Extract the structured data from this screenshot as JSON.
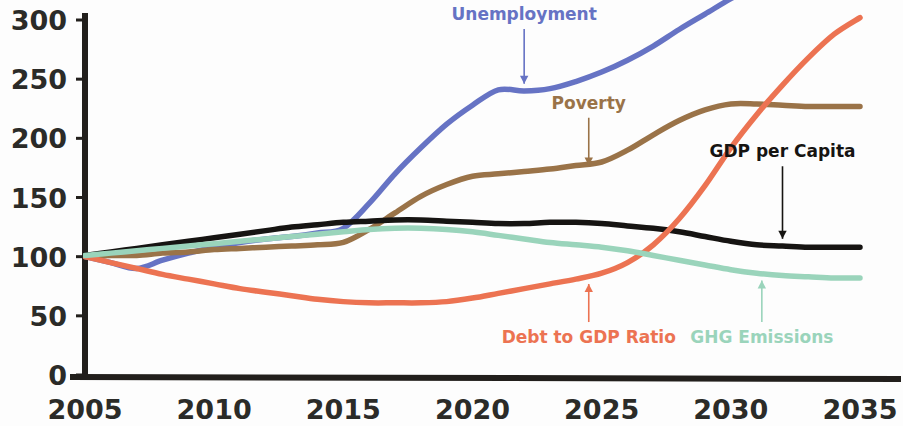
{
  "chart_data": {
    "type": "line",
    "title": "",
    "xlabel": "",
    "ylabel": "",
    "xlim": [
      2005,
      2035
    ],
    "ylim": [
      0,
      300
    ],
    "x_ticks": [
      "2005",
      "2010",
      "2015",
      "2020",
      "2025",
      "2030",
      "2035"
    ],
    "y_ticks": [
      "0",
      "50",
      "100",
      "150",
      "200",
      "250",
      "300"
    ],
    "grid": false,
    "legend_position": "inline-annotations",
    "index_base_note": "All series indexed to 100 at 2005",
    "x": [
      2005,
      2006,
      2007,
      2008,
      2009,
      2010,
      2011,
      2012,
      2013,
      2014,
      2015,
      2016,
      2017,
      2018,
      2019,
      2020,
      2021,
      2022,
      2023,
      2024,
      2025,
      2026,
      2027,
      2028,
      2029,
      2030,
      2031,
      2032,
      2033,
      2034,
      2035
    ],
    "series": [
      {
        "name": "Unemployment",
        "color": "#6673c4",
        "label_color": "#6673c4",
        "values": [
          100,
          95,
          90,
          97,
          103,
          108,
          112,
          115,
          117,
          120,
          124,
          145,
          170,
          192,
          212,
          228,
          241,
          240,
          242,
          248,
          256,
          266,
          278,
          292,
          305,
          318,
          330,
          342,
          354,
          366,
          378
        ],
        "label_x": 2022,
        "label_y": 300,
        "arrow_target_y": 241
      },
      {
        "name": "Poverty",
        "color": "#9a7348",
        "label_color": "#9a7348",
        "values": [
          100,
          101,
          101,
          103,
          104,
          106,
          107,
          108,
          109,
          110,
          112,
          123,
          137,
          151,
          161,
          168,
          170,
          172,
          174,
          177,
          180,
          190,
          203,
          215,
          224,
          229,
          229,
          228,
          227,
          227,
          227
        ],
        "label_x": 2024.5,
        "label_y": 225,
        "arrow_target_y": 172
      },
      {
        "name": "GDP per Capita",
        "color": "#161412",
        "label_color": "#161412",
        "values": [
          101,
          104,
          107,
          110,
          113,
          116,
          119,
          122,
          125,
          127,
          129,
          130,
          131,
          131,
          130,
          129,
          128,
          128,
          129,
          129,
          128,
          126,
          124,
          121,
          117,
          113,
          110,
          109,
          108,
          108,
          108
        ],
        "label_x": 2032,
        "label_y": 184,
        "arrow_target_y": 110
      },
      {
        "name": "Debt to GDP Ratio",
        "color": "#ec7352",
        "label_color": "#ec7352",
        "values": [
          100,
          95,
          90,
          85,
          81,
          77,
          73,
          70,
          67,
          64,
          62,
          61,
          61,
          61,
          62,
          65,
          69,
          73,
          77,
          81,
          86,
          95,
          110,
          132,
          160,
          192,
          220,
          245,
          268,
          288,
          302
        ],
        "label_x": 2024.5,
        "label_y": 27,
        "arrow_target_y": 82
      },
      {
        "name": "GHG Emissions",
        "color": "#9ad4bb",
        "label_color": "#9ad4bb",
        "values": [
          101,
          103,
          105,
          107,
          109,
          111,
          113,
          115,
          117,
          119,
          121,
          123,
          124,
          124,
          123,
          121,
          118,
          115,
          112,
          110,
          108,
          105,
          101,
          97,
          93,
          89,
          86,
          84,
          83,
          82,
          82
        ],
        "label_x": 2031.2,
        "label_y": 27,
        "arrow_target_y": 85
      }
    ]
  },
  "axis": {
    "y_axis_name": "value-axis",
    "x_axis_name": "year-axis"
  }
}
